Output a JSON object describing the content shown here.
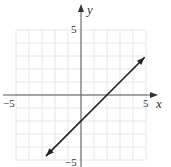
{
  "chart_data": {
    "type": "line",
    "title": "",
    "xlabel": "x",
    "ylabel": "y",
    "xlim": [
      -5,
      5
    ],
    "ylim": [
      -5,
      5
    ],
    "grid": true,
    "x_tick_labels": [
      "−5",
      "5"
    ],
    "y_tick_labels": [
      "5",
      "−5"
    ],
    "series": [
      {
        "name": "y = x − 2",
        "equation": "y = x - 2",
        "slope": 1,
        "intercept": -2,
        "x": [
          -2.7,
          4.9
        ],
        "y": [
          -4.7,
          2.9
        ],
        "arrows_both_ends": true
      }
    ],
    "x_intercept": 2,
    "y_intercept": -2
  },
  "labels": {
    "x_axis": "x",
    "y_axis": "y",
    "x_min": "−5",
    "x_max": "5",
    "y_max": "5",
    "y_min": "−5"
  },
  "colors": {
    "grid": "#e6e6e6",
    "axis": "#555555",
    "line": "#222222"
  }
}
